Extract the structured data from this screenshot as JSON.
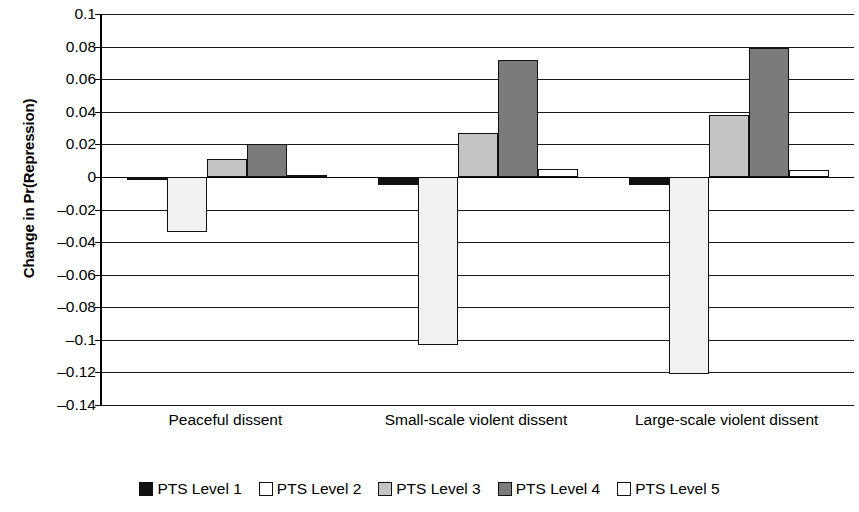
{
  "chart_data": {
    "type": "bar",
    "title": "",
    "xlabel": "",
    "ylabel": "Change in Pr(Repression)",
    "ylim": [
      -0.14,
      0.1
    ],
    "ytick_step": 0.02,
    "ytick_labels": [
      "0.1",
      "0.08",
      "0.06",
      "0.04",
      "0.02",
      "0",
      "–0.02",
      "–0.04",
      "–0.06",
      "–0.08",
      "–0.1",
      "–0.12",
      "–0.14"
    ],
    "ytick_values": [
      0.1,
      0.08,
      0.06,
      0.04,
      0.02,
      0,
      -0.02,
      -0.04,
      -0.06,
      -0.08,
      -0.1,
      -0.12,
      -0.14
    ],
    "grid": true,
    "legend_position": "bottom",
    "categories": [
      "Peaceful dissent",
      "Small-scale violent dissent",
      "Large-scale violent dissent"
    ],
    "series": [
      {
        "name": "PTS Level 1",
        "color": "#111111",
        "values": [
          -0.002,
          -0.005,
          -0.005
        ]
      },
      {
        "name": "PTS Level 2",
        "color": "#f1f1f1",
        "values": [
          -0.034,
          -0.103,
          -0.121
        ]
      },
      {
        "name": "PTS Level 3",
        "color": "#c4c4c4",
        "values": [
          0.011,
          0.027,
          0.038
        ]
      },
      {
        "name": "PTS Level 4",
        "color": "#7b7b7b",
        "values": [
          0.02,
          0.072,
          0.079
        ]
      },
      {
        "name": "PTS Level 5",
        "color": "#ffffff",
        "values": [
          0.001,
          0.005,
          0.004
        ]
      }
    ]
  },
  "legend": {
    "items": [
      {
        "label": "PTS Level 1",
        "color": "#111111"
      },
      {
        "label": "PTS Level 2",
        "color": "#ffffff"
      },
      {
        "label": "PTS Level 3",
        "color": "#c4c4c4"
      },
      {
        "label": "PTS Level 4",
        "color": "#7b7b7b"
      },
      {
        "label": "PTS Level 5",
        "color": "#ffffff"
      }
    ]
  }
}
